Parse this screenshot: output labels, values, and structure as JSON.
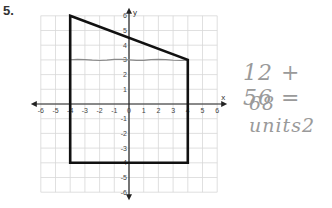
{
  "question": {
    "number": "5."
  },
  "graph": {
    "x_axis_label": "x",
    "y_axis_label": "y",
    "x_ticks": [
      "-6",
      "-5",
      "-4",
      "-3",
      "-2",
      "-1",
      "0",
      "1",
      "2",
      "3",
      "4",
      "5",
      "6"
    ],
    "y_ticks": [
      "6",
      "5",
      "4",
      "3",
      "2",
      "1",
      "-1",
      "-2",
      "-3",
      "-4",
      "-5",
      "-6"
    ],
    "range": {
      "xmin": -6,
      "xmax": 6,
      "ymin": -6,
      "ymax": 6
    },
    "shape": {
      "type": "trapezoid",
      "vertices": [
        [
          -4,
          6
        ],
        [
          4,
          3
        ],
        [
          4,
          -4
        ],
        [
          -4,
          -4
        ]
      ],
      "color": "#111111"
    },
    "divider_line": {
      "y": 3,
      "from_x": -4,
      "to_x": 4,
      "color": "#8a8a8a"
    }
  },
  "work": {
    "line1": "12 + 56 =",
    "line2": "68 units2"
  },
  "colors": {
    "grid": "#d8d8d8",
    "axis": "#222222",
    "handwriting": "#9a9a9a"
  }
}
